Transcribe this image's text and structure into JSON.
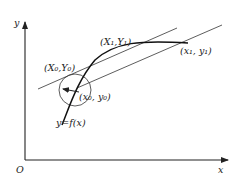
{
  "diagram": {
    "axes": {
      "y_label": "y",
      "x_label": "x",
      "origin_label": "O"
    },
    "points": {
      "upper_tangent_point": "(X₁,Y₁)",
      "start_point_transformed": "(X₀,Y₀)",
      "start_point": "(x₀, y₀)",
      "end_point": "(x₁, y₁)"
    },
    "curve_label": "y=f(x)",
    "colors": {
      "stroke": "#222222",
      "background": "#ffffff"
    }
  }
}
